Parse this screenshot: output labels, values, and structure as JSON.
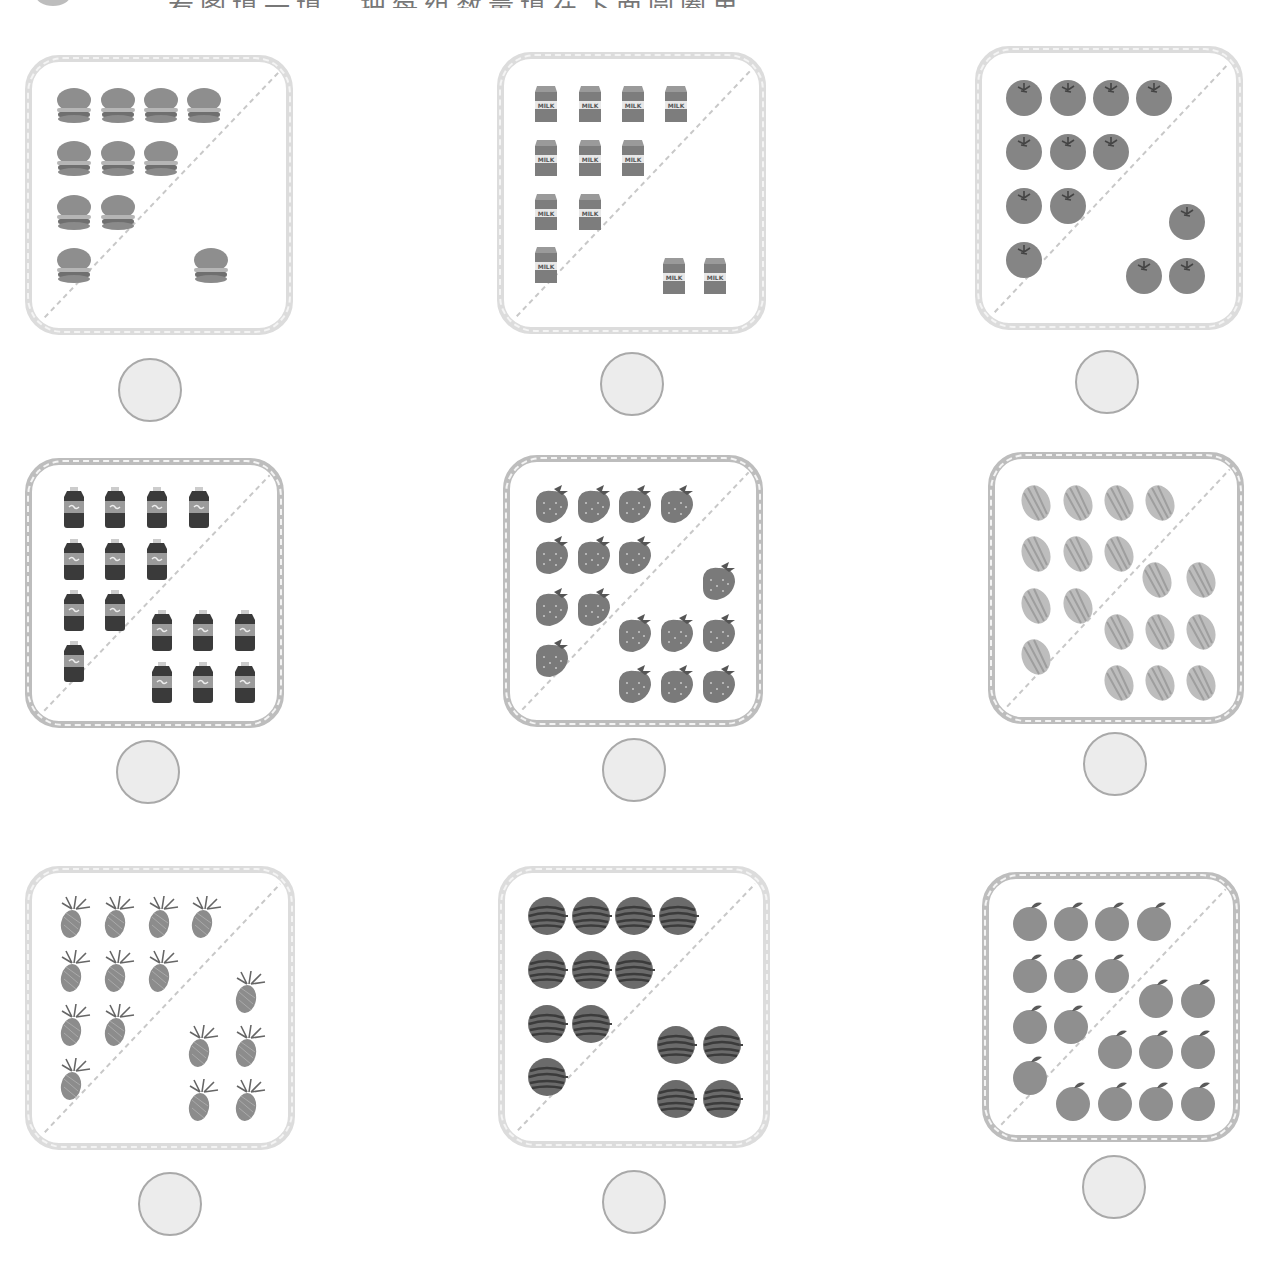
{
  "header": {
    "badge": "",
    "instruction": "看图填一填，把每组数量填在下面圆圈里"
  },
  "colors": {
    "card_border_light": "#dcdcdc",
    "card_border_dark": "#bdbdbd",
    "diagonal": "#c8c8c8",
    "circle_fill": "#ececec",
    "circle_stroke": "#a9a9a9"
  },
  "cards": [
    {
      "item": "burger",
      "icon": "burger-icon",
      "group_a": 10,
      "group_b": 1,
      "answer": ""
    },
    {
      "item": "milk",
      "icon": "milk-carton-icon",
      "group_a": 10,
      "group_b": 2,
      "answer": "",
      "label": "MILK"
    },
    {
      "item": "tomato",
      "icon": "tomato-icon",
      "group_a": 10,
      "group_b": 3,
      "answer": ""
    },
    {
      "item": "cola",
      "icon": "cola-bottle-icon",
      "group_a": 10,
      "group_b": 6,
      "answer": ""
    },
    {
      "item": "strawberry",
      "icon": "strawberry-icon",
      "group_a": 10,
      "group_b": 7,
      "answer": ""
    },
    {
      "item": "melon",
      "icon": "melon-icon",
      "group_a": 10,
      "group_b": 8,
      "answer": ""
    },
    {
      "item": "pineapple",
      "icon": "pineapple-icon",
      "group_a": 10,
      "group_b": 5,
      "answer": ""
    },
    {
      "item": "watermelon",
      "icon": "watermelon-icon",
      "group_a": 10,
      "group_b": 4,
      "answer": ""
    },
    {
      "item": "orange",
      "icon": "orange-icon",
      "group_a": 10,
      "group_b": 9,
      "answer": ""
    }
  ]
}
